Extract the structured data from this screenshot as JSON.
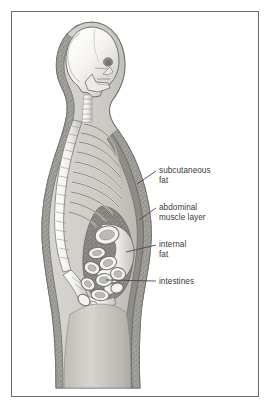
{
  "figure": {
    "border_color": "#6b6b6b",
    "background": "#ffffff",
    "text_color": "#3a3a3a",
    "style": "grayscale medical illustration, lateral (side) profile, facing right"
  },
  "labels": [
    {
      "id": "subcutaneous-fat",
      "text": "subcutaneous\nfat",
      "leader": "diagonal-up-right"
    },
    {
      "id": "abdominal-muscle-layer",
      "text": "abdominal\nmuscle layer",
      "leader": "diagonal-up-right"
    },
    {
      "id": "internal-fat",
      "text": "internal\nfat",
      "leader": "diagonal-up-right"
    },
    {
      "id": "intestines",
      "text": "intestines",
      "leader": "horizontal"
    }
  ],
  "anatomy": {
    "skeleton": [
      "skull",
      "mandible",
      "cervical vertebrae",
      "thoracic vertebrae",
      "rib cage",
      "lumbar vertebrae",
      "sacrum",
      "pelvis",
      "femur"
    ],
    "soft_tissue": [
      "skin outline",
      "subcutaneous fat band",
      "abdominal muscle layer",
      "internal visceral fat",
      "intestinal loops"
    ],
    "palette": {
      "bone": "#f2f1ee",
      "bone_shade": "#bdbbb6",
      "outline": "#6f6e6c",
      "fat_band": "#9e9c97",
      "internal_fat": "#8d8b86",
      "soft_tissue": "#cfcdc8",
      "leader_line": "#4a4a4a"
    }
  }
}
